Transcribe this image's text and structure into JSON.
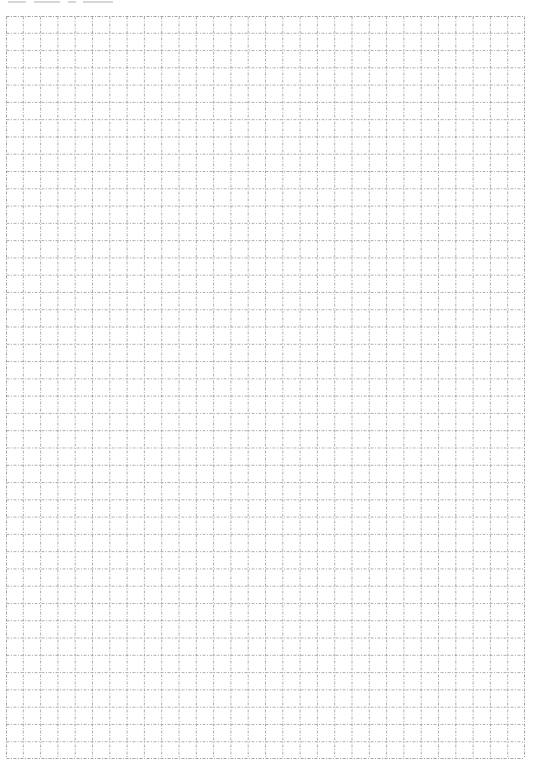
{
  "page": {
    "type": "graph-paper",
    "header_text_visible": false
  },
  "grid": {
    "columns": 30,
    "rows": 43,
    "cell_size_px": 17.3,
    "line_style": "dash-dot",
    "line_color": "#9a9a9a",
    "border_color": "#8a8a8a",
    "background": "#ffffff"
  }
}
